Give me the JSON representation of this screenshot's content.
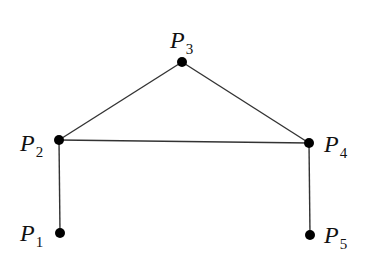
{
  "diagram": {
    "type": "graph",
    "nodes": [
      {
        "id": "P1",
        "label": "P",
        "sub": "1",
        "x": 60,
        "y": 233,
        "lx": 20,
        "ly": 241
      },
      {
        "id": "P2",
        "label": "P",
        "sub": "2",
        "x": 59,
        "y": 140,
        "lx": 20,
        "ly": 151
      },
      {
        "id": "P3",
        "label": "P",
        "sub": "3",
        "x": 182,
        "y": 62,
        "lx": 170,
        "ly": 48
      },
      {
        "id": "P4",
        "label": "P",
        "sub": "4",
        "x": 309,
        "y": 143,
        "lx": 324,
        "ly": 152
      },
      {
        "id": "P5",
        "label": "P",
        "sub": "5",
        "x": 310,
        "y": 235,
        "lx": 324,
        "ly": 243
      }
    ],
    "edges": [
      [
        "P1",
        "P2"
      ],
      [
        "P2",
        "P3"
      ],
      [
        "P3",
        "P4"
      ],
      [
        "P2",
        "P4"
      ],
      [
        "P4",
        "P5"
      ]
    ],
    "colors": {
      "line": "#333333",
      "node": "#000000",
      "text": "#111111"
    }
  }
}
